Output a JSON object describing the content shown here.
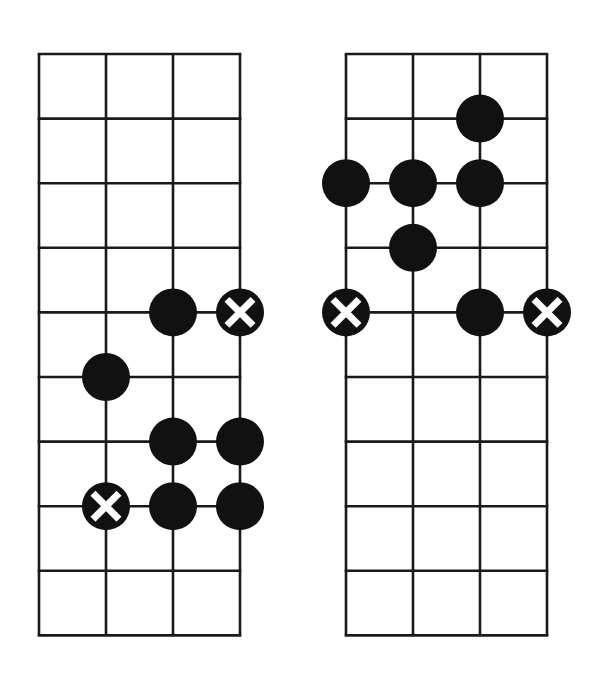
{
  "colors": {
    "background": "#ffffff",
    "line": "#1a1a1a",
    "dot": "#111111",
    "cross": "#ffffff"
  },
  "diagrams": [
    {
      "name": "left-fretboard",
      "origin": [
        39,
        54
      ],
      "columns": 3,
      "rows": 9,
      "col_width": 67,
      "row_height": 64.6,
      "markers": [
        {
          "type": "dot",
          "string": 2,
          "fret": 4
        },
        {
          "type": "root",
          "string": 3,
          "fret": 4
        },
        {
          "type": "dot",
          "string": 1,
          "fret": 5
        },
        {
          "type": "dot",
          "string": 2,
          "fret": 6
        },
        {
          "type": "dot",
          "string": 3,
          "fret": 6
        },
        {
          "type": "root",
          "string": 1,
          "fret": 7
        },
        {
          "type": "dot",
          "string": 2,
          "fret": 7
        },
        {
          "type": "dot",
          "string": 3,
          "fret": 7
        }
      ]
    },
    {
      "name": "right-fretboard",
      "origin": [
        346,
        54
      ],
      "columns": 3,
      "rows": 9,
      "col_width": 67,
      "row_height": 64.6,
      "markers": [
        {
          "type": "dot",
          "string": 2,
          "fret": 1
        },
        {
          "type": "dot",
          "string": 0,
          "fret": 2
        },
        {
          "type": "dot",
          "string": 1,
          "fret": 2
        },
        {
          "type": "dot",
          "string": 2,
          "fret": 2
        },
        {
          "type": "dot",
          "string": 1,
          "fret": 3
        },
        {
          "type": "root",
          "string": 0,
          "fret": 4
        },
        {
          "type": "dot",
          "string": 2,
          "fret": 4
        },
        {
          "type": "root",
          "string": 3,
          "fret": 4
        }
      ]
    }
  ],
  "marker_radius": 24
}
